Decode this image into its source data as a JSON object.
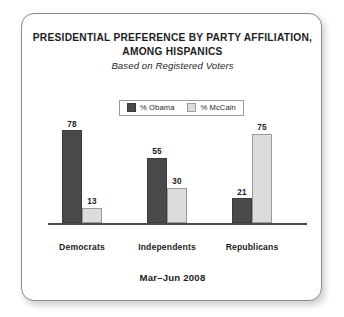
{
  "chart_data": {
    "type": "bar",
    "title": "PRESIDENTIAL PREFERENCE BY PARTY AFFILIATION, AMONG HISPANICS",
    "title_lines": [
      "PRESIDENTIAL PREFERENCE BY PARTY AFFILIATION,",
      "AMONG HISPANICS"
    ],
    "subtitle": "Based on Registered Voters",
    "footnote": "Mar–Jun 2008",
    "categories": [
      "Democrats",
      "Independents",
      "Republicans"
    ],
    "series": [
      {
        "name": "% Obama",
        "color": "#4a4a4a",
        "values": [
          78,
          55,
          21
        ]
      },
      {
        "name": "% McCain",
        "color": "#dcdcdc",
        "values": [
          13,
          30,
          75
        ]
      }
    ],
    "xlabel": "",
    "ylabel": "",
    "ylim": [
      0,
      92
    ],
    "grid": false,
    "legend_position": "top-center",
    "value_labels": true
  },
  "labels": {
    "values": {
      "democrats_obama": "78",
      "democrats_mccain": "13",
      "independents_obama": "55",
      "independents_mccain": "30",
      "republicans_obama": "21",
      "republicans_mccain": "75"
    }
  },
  "colors": {
    "obama_bar": "#4a4a4a",
    "mccain_bar": "#dcdcdc",
    "axis": "#4a4a4a",
    "frame_border": "#8a8a8a",
    "text": "#1d1d1d",
    "background": "#ffffff"
  }
}
